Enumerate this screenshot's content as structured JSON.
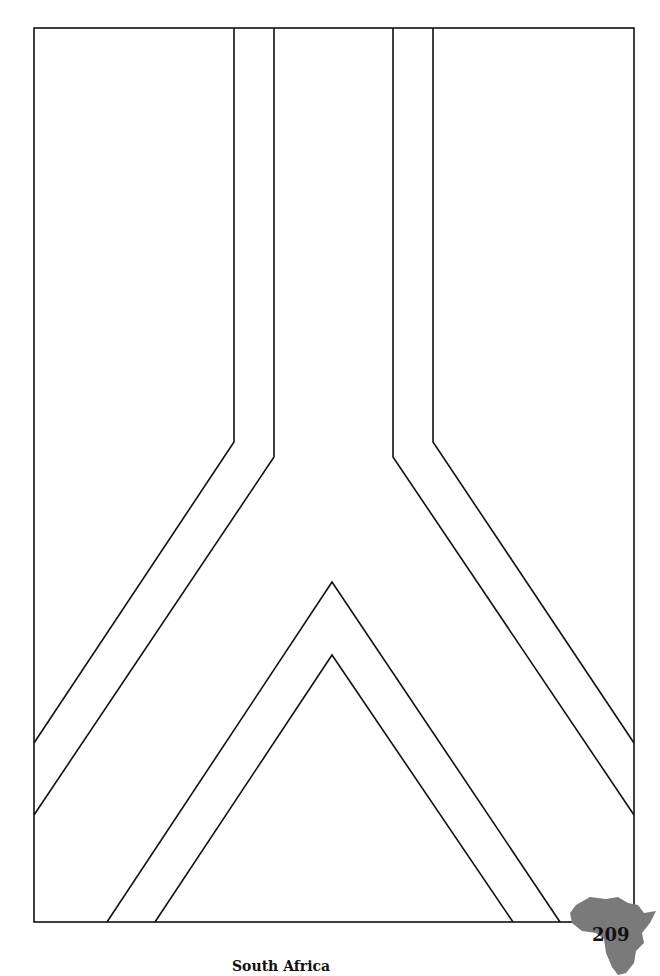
{
  "page": {
    "caption": "South Africa",
    "page_number": "209"
  },
  "colors": {
    "line": "#111111",
    "africa_fill": "#7a7a7a",
    "background": "#ffffff"
  }
}
